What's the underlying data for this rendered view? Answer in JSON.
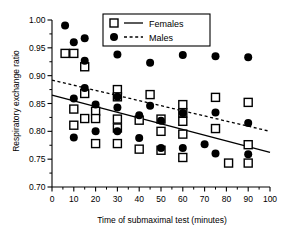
{
  "chart_data": {
    "type": "scatter",
    "title": "",
    "xlabel": "Time of submaximal test (minutes)",
    "ylabel": "Respiratory exchange ratio",
    "xlim": [
      0,
      100
    ],
    "ylim": [
      0.7,
      1.0
    ],
    "xticks": [
      0,
      10,
      20,
      30,
      40,
      50,
      60,
      70,
      80,
      90,
      100
    ],
    "xtick_labels": [
      "0",
      "10",
      "20",
      "30",
      "40",
      "50",
      "60",
      "70",
      "80",
      "90",
      "100"
    ],
    "yticks": [
      0.7,
      0.75,
      0.8,
      0.85,
      0.9,
      0.95,
      1.0
    ],
    "ytick_labels": [
      "0.70",
      "0.75",
      "0.80",
      "0.85",
      "0.90",
      "0.95",
      "1.00"
    ],
    "grid": false,
    "legend_position": "top-center",
    "series": [
      {
        "name": "Females",
        "marker": "open-square",
        "line_style": "solid",
        "color": "#000000",
        "points": [
          [
            6,
            0.94
          ],
          [
            10,
            0.94
          ],
          [
            15,
            0.916
          ],
          [
            10,
            0.84
          ],
          [
            10,
            0.811
          ],
          [
            15,
            0.823
          ],
          [
            15,
            0.868
          ],
          [
            20,
            0.836
          ],
          [
            20,
            0.823
          ],
          [
            20,
            0.778
          ],
          [
            30,
            0.875
          ],
          [
            30,
            0.862
          ],
          [
            30,
            0.822
          ],
          [
            30,
            0.806
          ],
          [
            30,
            0.778
          ],
          [
            40,
            0.82
          ],
          [
            40,
            0.768
          ],
          [
            45,
            0.866
          ],
          [
            50,
            0.822
          ],
          [
            50,
            0.8
          ],
          [
            50,
            0.766
          ],
          [
            60,
            0.848
          ],
          [
            60,
            0.833
          ],
          [
            60,
            0.818
          ],
          [
            60,
            0.795
          ],
          [
            60,
            0.753
          ],
          [
            75,
            0.861
          ],
          [
            75,
            0.805
          ],
          [
            81,
            0.743
          ],
          [
            90,
            0.852
          ],
          [
            90,
            0.776
          ],
          [
            90,
            0.743
          ]
        ],
        "fit_line": {
          "x": [
            0,
            100
          ],
          "y": [
            0.865,
            0.762
          ]
        }
      },
      {
        "name": "Males",
        "marker": "filled-circle",
        "line_style": "dashed",
        "color": "#000000",
        "points": [
          [
            6,
            0.99
          ],
          [
            10,
            0.96
          ],
          [
            15,
            0.967
          ],
          [
            15,
            0.927
          ],
          [
            10,
            0.859
          ],
          [
            10,
            0.789
          ],
          [
            15,
            0.878
          ],
          [
            20,
            0.848
          ],
          [
            20,
            0.8
          ],
          [
            30,
            0.938
          ],
          [
            30,
            0.862
          ],
          [
            30,
            0.843
          ],
          [
            30,
            0.8
          ],
          [
            40,
            0.829
          ],
          [
            40,
            0.788
          ],
          [
            45,
            0.923
          ],
          [
            45,
            0.846
          ],
          [
            50,
            0.819
          ],
          [
            50,
            0.77
          ],
          [
            60,
            0.937
          ],
          [
            60,
            0.833
          ],
          [
            60,
            0.77
          ],
          [
            70,
            0.777
          ],
          [
            75,
            0.935
          ],
          [
            75,
            0.834
          ],
          [
            75,
            0.76
          ],
          [
            90,
            0.933
          ],
          [
            90,
            0.815
          ],
          [
            90,
            0.759
          ]
        ],
        "fit_line": {
          "x": [
            0,
            100
          ],
          "y": [
            0.892,
            0.8
          ]
        }
      }
    ],
    "legend": [
      {
        "label": "Females",
        "marker": "open-square",
        "line_style": "solid"
      },
      {
        "label": "Males",
        "marker": "filled-circle",
        "line_style": "dashed"
      }
    ]
  }
}
